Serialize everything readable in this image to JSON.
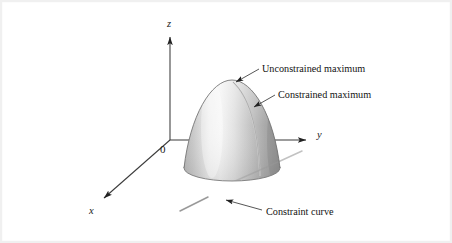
{
  "figure": {
    "kind": "3d-surface-diagram",
    "background_color": "#ffffff",
    "border_color": "#f0f0f0",
    "ink_color": "#1a1a1a",
    "surface_light_color": "#f2f2f2",
    "surface_mid_color": "#bfbfbf",
    "surface_dark_color": "#8d8d8d"
  },
  "axes": {
    "origin_label": "0",
    "z_label": "z",
    "y_label": "y",
    "x_label": "x",
    "origin_point": [
      170,
      140
    ],
    "z_tip": [
      170,
      31
    ],
    "y_tip": [
      312,
      140
    ],
    "x_tip": [
      99,
      201
    ]
  },
  "annotations": [
    {
      "id": "unconstrained-maximum",
      "label": "Unconstrained maximum",
      "text_x": 262,
      "text_y": 73,
      "leader_from": [
        258,
        70
      ],
      "leader_to": [
        233,
        83
      ]
    },
    {
      "id": "constrained-maximum",
      "label": "Constrained maximum",
      "text_x": 277,
      "text_y": 99,
      "leader_from": [
        274,
        96
      ],
      "leader_to": [
        251,
        108
      ]
    },
    {
      "id": "constraint-curve",
      "label": "Constraint curve",
      "text_x": 265,
      "text_y": 214,
      "leader_from": [
        261,
        210
      ],
      "leader_to": [
        222,
        199
      ]
    }
  ],
  "surface": {
    "name": "paraboloid-dome",
    "apex": [
      232,
      80
    ],
    "base_center": [
      232,
      168
    ],
    "base_rx": 48,
    "base_ry": 13
  },
  "constraint": {
    "name": "constraint-line",
    "start": [
      180,
      210
    ],
    "end": [
      302,
      152
    ]
  }
}
